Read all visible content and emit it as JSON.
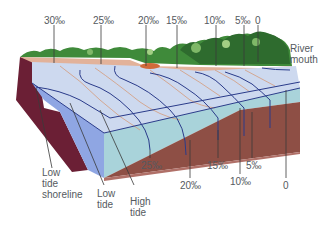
{
  "diagram": {
    "unit": "‰",
    "surface_labels": [
      {
        "text": "30‰",
        "x": 44,
        "y": 15
      },
      {
        "text": "25‰",
        "x": 93,
        "y": 15
      },
      {
        "text": "20‰",
        "x": 138,
        "y": 15
      },
      {
        "text": "15‰",
        "x": 165,
        "y": 15
      },
      {
        "text": "10‰",
        "x": 204,
        "y": 15
      },
      {
        "text": "5‰",
        "x": 234,
        "y": 15
      },
      {
        "text": "0",
        "x": 255,
        "y": 15
      }
    ],
    "river_mouth_label": {
      "line1": "River",
      "line2": "mouth"
    },
    "bottom_salinity_labels": [
      {
        "text": "25‰",
        "x": 141,
        "y": 160
      },
      {
        "text": "20‰",
        "x": 180,
        "y": 180
      },
      {
        "text": "15‰",
        "x": 207,
        "y": 160
      },
      {
        "text": "10‰",
        "x": 230,
        "y": 176
      },
      {
        "text": "5‰",
        "x": 246,
        "y": 160
      },
      {
        "text": "0",
        "x": 284,
        "y": 180
      }
    ],
    "zone_labels": {
      "low_tide_shoreline": {
        "line1": "Low",
        "line2": "tide",
        "line3": "shoreline"
      },
      "low_tide": {
        "line1": "Low",
        "line2": "tide"
      },
      "high_tide": {
        "line1": "High",
        "line2": "tide"
      }
    },
    "colors": {
      "water_surface": "#cdd9ef",
      "water_front": "#a9d3da",
      "water_side": "#8fa6e3",
      "sediment": "#8e4f45",
      "cliff": "#6b1f35",
      "beach": "#e2b29a",
      "vegetation_dark": "#2e6b2e",
      "vegetation_light": "#7fb868",
      "isohaline": "#2a3b8a",
      "isohaline_surface": "#d49a7a",
      "leader_line": "#4a4a4a",
      "label_text": "#555a60"
    }
  }
}
